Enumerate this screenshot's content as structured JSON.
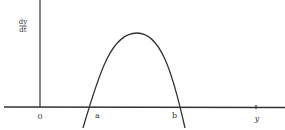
{
  "diagram": {
    "type": "phase-line-plot",
    "y_axis_label_numerator": "dy",
    "y_axis_label_denominator": "dt",
    "x_axis_label": "y",
    "origin_label": "0",
    "root_labels": [
      "a",
      "b"
    ],
    "curve_description": "downward parabola crossing the horizontal axis at a and b, positive between them"
  },
  "colors": {
    "line": "#333333",
    "background": "#ffffff"
  }
}
